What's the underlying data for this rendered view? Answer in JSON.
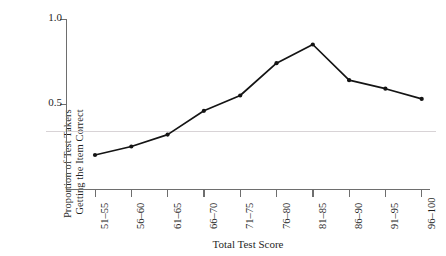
{
  "chart_data": {
    "type": "line",
    "title": "",
    "xlabel": "Total Test Score",
    "ylabel_line1": "Proportion of Test Takers",
    "ylabel_line2": "Getting the Item Correct",
    "categories": [
      "51–55",
      "56–60",
      "61–65",
      "66–70",
      "71–75",
      "76–80",
      "81–85",
      "86–90",
      "91–95",
      "96–100"
    ],
    "values": [
      0.2,
      0.25,
      0.32,
      0.46,
      0.55,
      0.74,
      0.85,
      0.64,
      0.59,
      0.53
    ],
    "series": [
      {
        "name": "Proportion Correct",
        "values": [
          0.2,
          0.25,
          0.32,
          0.46,
          0.55,
          0.74,
          0.85,
          0.64,
          0.59,
          0.53
        ]
      }
    ],
    "ylim": [
      0.0,
      1.0
    ],
    "ytick_values": [
      0.5,
      1.0
    ],
    "ytick_labels": [
      "0.5",
      "1.0"
    ],
    "reference_line_value": 0.34,
    "grid": false,
    "legend": "none",
    "marker": "filled-circle",
    "line_color": "#141414",
    "axis_color": "#6e6e6e",
    "reference_line_color": "#d8d3d6",
    "background_color": "#ffffff"
  }
}
